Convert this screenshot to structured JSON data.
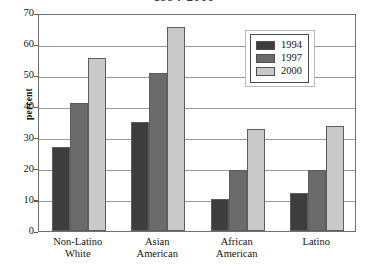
{
  "chart_data": {
    "type": "bar",
    "title": "1994-2000",
    "xlabel": "",
    "ylabel": "percent",
    "ylim": [
      0,
      70
    ],
    "ytick_step": 10,
    "yticks": [
      0,
      10,
      20,
      30,
      40,
      50,
      60,
      70
    ],
    "ytick_labels": [
      "0",
      "10",
      "20",
      "30",
      "40",
      "50",
      "60",
      "70"
    ],
    "grid": true,
    "grid_axis": "y",
    "legend_position": "top-right-inside",
    "categories": [
      "Non-Latino White",
      "Asian American",
      "African American",
      "Latino"
    ],
    "category_lines": [
      [
        "Non-Latino",
        "White"
      ],
      [
        "Asian",
        "American"
      ],
      [
        "African",
        "American"
      ],
      [
        "Latino"
      ]
    ],
    "series": [
      {
        "name": "1994",
        "color": "#3d3d3d",
        "values": [
          27.0,
          35.0,
          10.3,
          12.3
        ]
      },
      {
        "name": "1997",
        "color": "#6b6b6b",
        "values": [
          41.0,
          50.8,
          19.5,
          19.5
        ]
      },
      {
        "name": "2000",
        "color": "#c9c9c9",
        "values": [
          55.5,
          65.5,
          32.6,
          33.6
        ]
      }
    ]
  },
  "colors": {
    "series_1994": "#3d3d3d",
    "series_1997": "#6b6b6b",
    "series_2000": "#c9c9c9",
    "axis": "#6e6e6e",
    "gridline": "#9a9a9a",
    "text": "#141414",
    "background": "#ffffff"
  }
}
